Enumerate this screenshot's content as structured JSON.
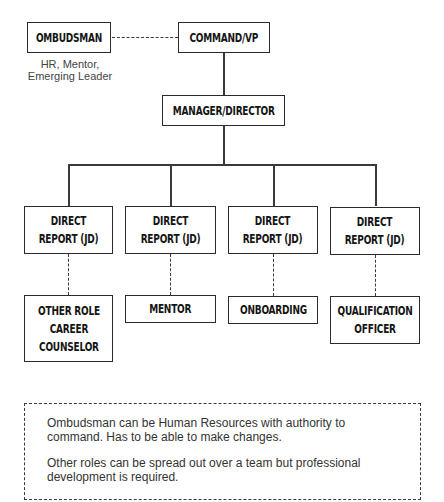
{
  "chart": {
    "top": {
      "ombudsman": "OMBUDSMAN",
      "ombudsman_caption": "HR, Mentor,\nEmerging Leader",
      "command": "COMMAND/VP",
      "manager": "MANAGER/DIRECTOR"
    },
    "direct_reports": [
      {
        "label": "DIRECT\nREPORT (JD)",
        "role": "OTHER ROLE\nCAREER\nCOUNSELOR"
      },
      {
        "label": "DIRECT\nREPORT (JD)",
        "role": "MENTOR"
      },
      {
        "label": "DIRECT\nREPORT (JD)",
        "role": "ONBOARDING"
      },
      {
        "label": "DIRECT\nREPORT (JD)",
        "role": "QUALIFICATION\nOFFICER"
      }
    ],
    "note": {
      "paragraph_1": "Ombudsman can be Human Resources with authority to command. Has to be able to make changes.",
      "paragraph_2": "Other roles can be spread out over a team but professional development is required."
    }
  },
  "colors": {
    "line": "#3a3a3a",
    "text": "#151515",
    "background": "#ffffff"
  }
}
